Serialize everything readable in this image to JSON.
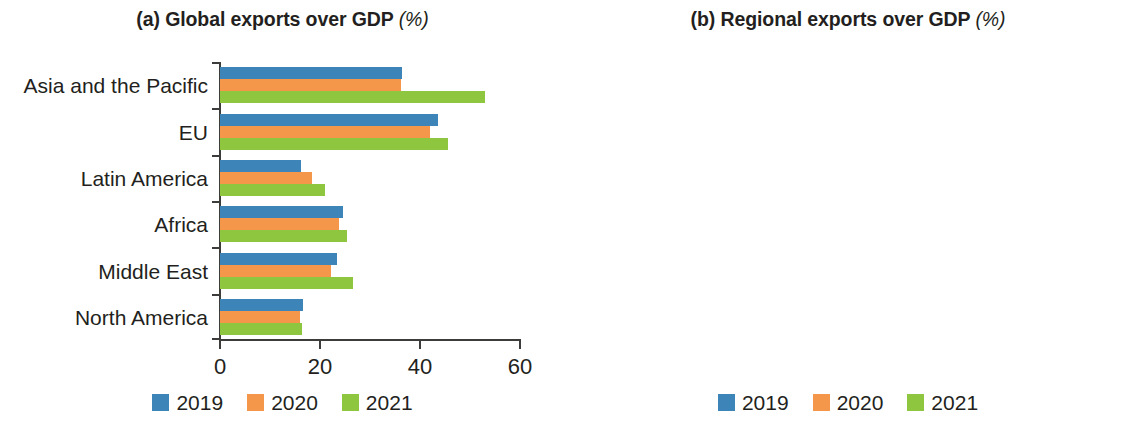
{
  "figure": {
    "background": "#ffffff",
    "series_colors": {
      "2019": "#3d85b8",
      "2020": "#f4974a",
      "2021": "#8ec63f"
    }
  },
  "panels": [
    {
      "id": "panel-a",
      "label": "(a)",
      "title_main": "(a) Global exports over GDP",
      "title_unit": "(%)"
    },
    {
      "id": "panel-b",
      "label": "(b)",
      "title_main": "(b) Regional exports over GDP",
      "title_unit": "(%)"
    }
  ],
  "legend": {
    "items": [
      {
        "label": "2019",
        "color": "#3d85b8"
      },
      {
        "label": "2020",
        "color": "#f4974a"
      },
      {
        "label": "2021",
        "color": "#8ec63f"
      }
    ]
  },
  "chart_data": [
    {
      "type": "bar",
      "orientation": "horizontal",
      "title": "(a) Global exports over GDP (%)",
      "xlabel": "",
      "ylabel": "",
      "unit": "%",
      "xlim": [
        0,
        60
      ],
      "xticks": [
        0,
        20,
        40,
        60
      ],
      "xtick_labels": [
        "0",
        "20",
        "40",
        "60"
      ],
      "grid": false,
      "legend_position": "bottom-center",
      "categories": [
        "Asia and the Pacific",
        "EU",
        "Latin America",
        "Africa",
        "Middle East",
        "North America"
      ],
      "series": [
        {
          "name": "2019",
          "color": "#3d85b8",
          "values": [
            36.4,
            43.6,
            16.2,
            24.6,
            23.4,
            16.6
          ]
        },
        {
          "name": "2020",
          "color": "#f4974a",
          "values": [
            36.2,
            42.0,
            18.3,
            23.8,
            22.1,
            16.0
          ]
        },
        {
          "name": "2021",
          "color": "#8ec63f",
          "values": [
            53.0,
            45.6,
            21.0,
            25.4,
            26.6,
            16.3
          ]
        }
      ]
    },
    {
      "type": "bar",
      "orientation": "horizontal",
      "title": "(b) Regional exports over GDP (%)",
      "xlabel": "",
      "ylabel": "",
      "unit": "%",
      "xlim": [
        0,
        40
      ],
      "xticks": [
        0,
        20,
        40
      ],
      "xtick_labels": [
        "0",
        "20",
        "40"
      ],
      "grid": false,
      "legend_position": "bottom-center",
      "categories": [
        "Asia and the Pacific",
        "EU",
        "Latin America",
        "Africa",
        "Middle East",
        "North America"
      ],
      "series": [
        {
          "name": "2019",
          "color": "#3d85b8",
          "values": [
            21.2,
            33.7,
            4.4,
            8.1,
            4.3,
            10.3
          ]
        },
        {
          "name": "2020",
          "color": "#f4974a",
          "values": [
            19.3,
            32.9,
            5.1,
            7.7,
            4.9,
            9.5
          ]
        },
        {
          "name": "2021",
          "color": "#8ec63f",
          "values": [
            28.9,
            35.4,
            5.4,
            7.4,
            6.1,
            10.0
          ]
        }
      ]
    }
  ]
}
